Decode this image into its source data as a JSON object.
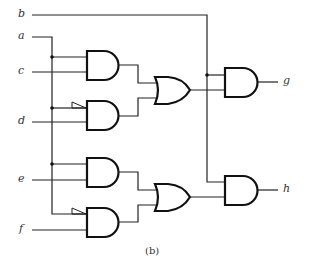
{
  "inputs": [
    {
      "name": "b",
      "y": 15
    },
    {
      "name": "a",
      "y": 37
    },
    {
      "name": "c",
      "y": 72
    },
    {
      "name": "d",
      "y": 122
    },
    {
      "name": "e",
      "y": 180
    },
    {
      "name": "f",
      "y": 230
    }
  ],
  "outputs": [
    {
      "name": "g",
      "y": 82
    },
    {
      "name": "h",
      "y": 190
    }
  ],
  "caption": "(b)",
  "gates": [
    {
      "id": "and1",
      "type": "AND",
      "inputs": [
        "a",
        "c"
      ]
    },
    {
      "id": "and2",
      "type": "AND",
      "inputs": [
        "a'",
        "d"
      ]
    },
    {
      "id": "or1",
      "type": "OR",
      "inputs": [
        "and1",
        "and2"
      ]
    },
    {
      "id": "and3",
      "type": "AND",
      "inputs": [
        "a",
        "e"
      ]
    },
    {
      "id": "and4",
      "type": "AND",
      "inputs": [
        "a'",
        "f"
      ]
    },
    {
      "id": "or2",
      "type": "OR",
      "inputs": [
        "and3",
        "and4"
      ]
    },
    {
      "id": "and5",
      "type": "AND",
      "inputs": [
        "b",
        "or1"
      ],
      "output": "g"
    },
    {
      "id": "and6",
      "type": "AND",
      "inputs": [
        "b",
        "or2"
      ],
      "output": "h"
    }
  ],
  "labels": {
    "b": "b",
    "a": "a",
    "c": "c",
    "d": "d",
    "e": "e",
    "f": "f",
    "g": "g",
    "h": "h"
  }
}
